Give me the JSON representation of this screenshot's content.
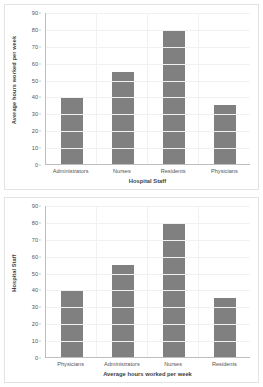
{
  "chart_data": [
    {
      "id": "top",
      "type": "bar",
      "title": "",
      "categories": [
        "Administrators",
        "Nurses",
        "Residents",
        "Physicians"
      ],
      "values": [
        40,
        55,
        80,
        35
      ],
      "xlabel": "Hospital Staff",
      "ylabel": "Average hours worked per week",
      "ylim": [
        0,
        90
      ],
      "ytick_step": 10,
      "yticks": [
        90,
        80,
        70,
        60,
        50,
        40,
        30,
        20,
        10,
        0
      ],
      "grid": true,
      "legend": false,
      "bar_color": "#808080",
      "gridline_color": "#f1f1f1",
      "axis_color": "#bdbdbd"
    },
    {
      "id": "bottom",
      "type": "bar",
      "title": "",
      "categories": [
        "Physicians",
        "Administrators",
        "Nurses",
        "Residents"
      ],
      "values": [
        40,
        55,
        80,
        35
      ],
      "xlabel": "Average hours worked per week",
      "ylabel": "Hospital Staff",
      "ylim": [
        0,
        90
      ],
      "ytick_step": 10,
      "yticks": [
        90,
        80,
        70,
        60,
        50,
        40,
        30,
        20,
        10,
        0
      ],
      "grid": true,
      "legend": false,
      "bar_color": "#808080",
      "gridline_color": "#f1f1f1",
      "axis_color": "#bdbdbd"
    }
  ]
}
